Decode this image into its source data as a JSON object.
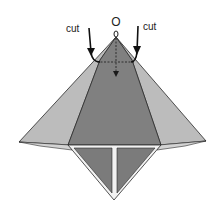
{
  "diagram": {
    "point_label": "O",
    "cut_left_label": "cut",
    "cut_right_label": "cut",
    "colors": {
      "light_gray": "#b9b9b9",
      "mid_gray": "#9e9e9e",
      "dark_gray": "#7f7f7f",
      "outline": "#2a2a2a",
      "background": "#ffffff"
    }
  }
}
